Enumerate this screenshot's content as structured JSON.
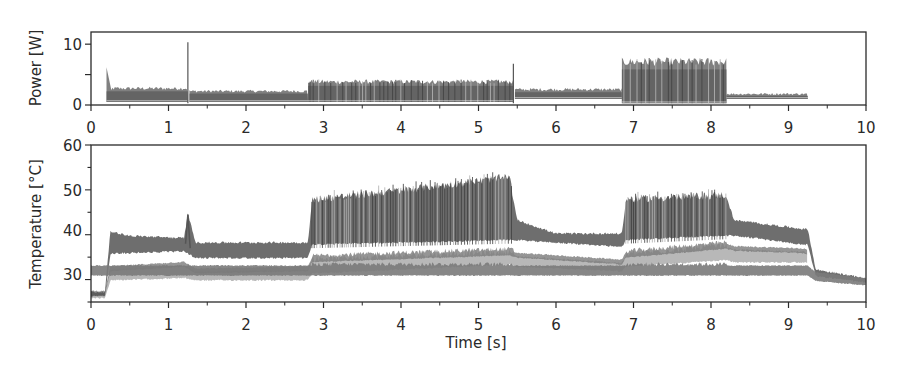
{
  "chart_data": [
    {
      "type": "line",
      "panel": "top",
      "title": "",
      "xlabel": "",
      "ylabel": "Power [W]",
      "xlim": [
        0,
        10
      ],
      "ylim": [
        0,
        12
      ],
      "x_ticks": [
        0,
        1,
        2,
        3,
        4,
        5,
        6,
        7,
        8,
        9,
        10
      ],
      "y_ticks": [
        0,
        5,
        10
      ],
      "y_tick_labels": [
        "0",
        "",
        "10"
      ],
      "grid": false,
      "legend": null,
      "description": "Many overlapping noisy gray power traces, one per run",
      "phases": [
        {
          "t_start": 0.2,
          "t_end": 1.25,
          "upper_W": 3.0,
          "lower_W": 0.5,
          "spike_start_W": 6.2
        },
        {
          "t_start": 1.25,
          "t_end": 1.27,
          "spike_W": 10.3
        },
        {
          "t_start": 1.27,
          "t_end": 2.8,
          "upper_W": 2.5,
          "lower_W": 0.5
        },
        {
          "t_start": 2.8,
          "t_end": 5.45,
          "upper_W": 4.2,
          "lower_W": 0.5
        },
        {
          "t_start": 5.45,
          "t_end": 5.47,
          "spike_W": 6.8
        },
        {
          "t_start": 5.47,
          "t_end": 6.85,
          "upper_W": 2.8,
          "lower_W": 1.0
        },
        {
          "t_start": 6.85,
          "t_end": 8.2,
          "upper_W": 7.8,
          "lower_W": 0.3
        },
        {
          "t_start": 8.2,
          "t_end": 9.25,
          "upper_W": 2.0,
          "lower_W": 1.0
        }
      ],
      "series_summary": {
        "x": [
          0.2,
          1.25,
          1.27,
          2.8,
          5.45,
          5.47,
          6.85,
          8.2,
          9.25
        ],
        "upper": [
          3.5,
          10.3,
          2.6,
          4.2,
          6.8,
          2.8,
          7.8,
          2.2,
          1.8
        ],
        "lower": [
          0.5,
          0.5,
          0.5,
          0.5,
          1.0,
          1.0,
          0.3,
          1.0,
          1.0
        ]
      }
    },
    {
      "type": "line",
      "panel": "bottom",
      "title": "",
      "xlabel": "Time [s]",
      "ylabel": "Temperature [°C]",
      "xlim": [
        0,
        10
      ],
      "ylim": [
        25,
        60
      ],
      "x_ticks": [
        0,
        1,
        2,
        3,
        4,
        5,
        6,
        7,
        8,
        9,
        10
      ],
      "y_ticks": [
        30,
        40,
        50,
        60
      ],
      "grid": false,
      "legend": null,
      "description": "Many overlapping noisy gray temperature traces (dark upper band, light lower band)",
      "series": [
        {
          "name": "upper band (hot sensors)",
          "x": [
            0,
            0.18,
            0.25,
            0.5,
            1.2,
            1.25,
            1.35,
            2.8,
            2.85,
            4.0,
            5.4,
            5.5,
            6.0,
            6.85,
            6.9,
            8.2,
            8.3,
            9.2,
            9.25,
            9.35,
            10
          ],
          "y": [
            27,
            27,
            40.5,
            39.5,
            39,
            44.5,
            38,
            38,
            47,
            49,
            52,
            43,
            40,
            40,
            47,
            48,
            43,
            41,
            41,
            32,
            30
          ]
        },
        {
          "name": "upper band lower edge",
          "x": [
            0,
            0.18,
            0.25,
            1.2,
            1.35,
            2.8,
            2.85,
            5.4,
            5.5,
            6.85,
            6.9,
            8.2,
            8.3,
            9.2,
            9.25,
            9.35,
            10
          ],
          "y": [
            26.5,
            26.5,
            36,
            36.5,
            35,
            35,
            38,
            39,
            39,
            37.5,
            39,
            40,
            40,
            38,
            38,
            31,
            29.5
          ]
        },
        {
          "name": "lower band (cool sensors)",
          "x": [
            0,
            0.18,
            0.25,
            1.2,
            1.35,
            2.8,
            2.85,
            5.4,
            5.5,
            6.85,
            6.9,
            8.2,
            8.3,
            9.2,
            9.25,
            9.35,
            10
          ],
          "y": [
            26.5,
            26.5,
            32,
            33,
            31.5,
            32,
            34,
            35.5,
            35,
            33.5,
            35,
            37,
            36.5,
            36,
            35.5,
            31,
            29.5
          ]
        },
        {
          "name": "lowest trace",
          "x": [
            0,
            0.18,
            0.25,
            1.2,
            1.35,
            2.8,
            2.85,
            5.4,
            5.5,
            6.85,
            6.9,
            8.2,
            8.3,
            9.2,
            9.25
          ],
          "y": [
            26,
            26,
            30,
            30.5,
            30,
            30,
            31.5,
            33.5,
            33,
            32,
            33,
            34.5,
            34,
            34,
            34
          ]
        }
      ]
    }
  ],
  "top": {
    "ylabel": "Power [W]",
    "ytick_labels": [
      "0",
      "10"
    ],
    "xtick_labels": [
      "0",
      "1",
      "2",
      "3",
      "4",
      "5",
      "6",
      "7",
      "8",
      "9",
      "10"
    ]
  },
  "bottom": {
    "ylabel": "Temperature [°C]",
    "xlabel": "Time [s]",
    "ytick_labels": [
      "30",
      "40",
      "50",
      "60"
    ],
    "xtick_labels": [
      "0",
      "1",
      "2",
      "3",
      "4",
      "5",
      "6",
      "7",
      "8",
      "9",
      "10"
    ]
  },
  "colors": {
    "axis": "#2a2a2a",
    "trace_dark": "#555555",
    "trace_mid": "#7a7a7a",
    "trace_light": "#b0b0b0"
  }
}
